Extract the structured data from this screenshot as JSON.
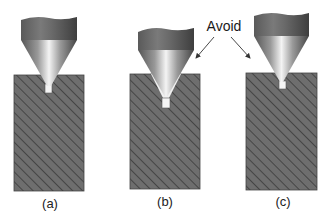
{
  "annotation": {
    "text": "Avoid",
    "arrows": [
      "points to panel (b)",
      "points to panel (c)"
    ]
  },
  "panels": [
    {
      "id": "a",
      "label": "(a)",
      "description": "Drill tip correctly centered; pilot hole just below surface"
    },
    {
      "id": "b",
      "label": "(b)",
      "description": "Conical countersink too deep; clearance gaps along cone flanks"
    },
    {
      "id": "c",
      "label": "(c)",
      "description": "Drill tip only slightly engaged, offset to side"
    }
  ],
  "colors": {
    "block_fill": "#6e6e6e",
    "hatch": "#3a3a3a",
    "shank_dark": "#4a4a4a",
    "shank_light": "#8a8a8a",
    "cone_highlight": "#f2f2f2",
    "text": "#222222"
  }
}
